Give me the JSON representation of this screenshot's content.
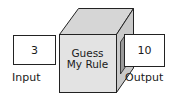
{
  "diagram": {
    "machine": {
      "line1": "Guess",
      "line2": "My Rule"
    },
    "input": {
      "value": "3",
      "label": "Input"
    },
    "output": {
      "value": "10",
      "label": "Output"
    }
  },
  "colors": {
    "front_face": "#e2e2e2",
    "top_face": "#d4d4d4",
    "side_face": "#c8c8c8",
    "stroke": "#222222",
    "box_fill": "#ffffff"
  }
}
